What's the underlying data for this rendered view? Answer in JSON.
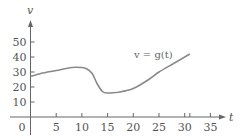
{
  "chart_data": {
    "type": "line",
    "title": "",
    "xlabel": "t",
    "ylabel": "v",
    "annotation": "v = g(t)",
    "x_ticks": [
      0,
      5,
      10,
      15,
      20,
      25,
      30,
      35
    ],
    "x_tick_labels": [
      "0",
      "5",
      "10",
      "15",
      "20",
      "25",
      "30",
      "35"
    ],
    "y_ticks": [
      10,
      20,
      30,
      40,
      50
    ],
    "y_tick_labels": [
      "10",
      "20",
      "30",
      "40",
      "50"
    ],
    "extra_x_tick": 31,
    "xlim": [
      -3.5,
      38
    ],
    "ylim": [
      -10,
      58
    ],
    "grid": false,
    "legend": "none",
    "series": [
      {
        "name": "v = g(t)",
        "x": [
          0,
          2,
          5,
          8,
          10,
          11,
          12,
          13,
          14,
          15,
          17,
          20,
          23,
          25,
          28,
          31
        ],
        "values": [
          27,
          29,
          31,
          33,
          33,
          32,
          29,
          22,
          17,
          16,
          16.5,
          19,
          25,
          30,
          36,
          42
        ]
      }
    ],
    "colors": {
      "curve": "#8a8a8a",
      "axes": "#666666",
      "text": "#555555"
    }
  }
}
